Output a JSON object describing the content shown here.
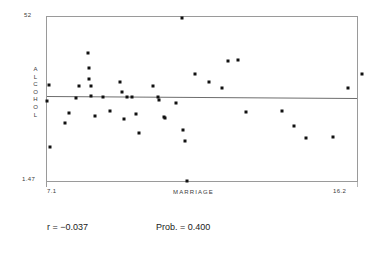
{
  "figure": {
    "kind": "scatter-plot-with-regression-line"
  },
  "axes": {
    "y_title_letters": [
      "A",
      "L",
      "C",
      "O",
      "H",
      "O",
      "L"
    ],
    "y_title": "ALCOHOL",
    "y_max_label": "52",
    "y_min_label": "1.47",
    "x_title": "MARRIAGE",
    "x_min_label": "7.1",
    "x_max_label": "16.2"
  },
  "stats": {
    "r_label": "r = −0.037",
    "prob_label": "Prob. = 0.400"
  },
  "colors": {
    "point": "#111111",
    "frame": "#9a9a9a",
    "regression_line": "#6d6d6d",
    "background": "#ffffff",
    "text": "#1a1a1a"
  },
  "chart_data": {
    "type": "scatter",
    "title": "",
    "xlabel": "MARRIAGE",
    "ylabel": "ALCOHOL",
    "xlim": [
      7.1,
      16.2
    ],
    "ylim": [
      1.47,
      52
    ],
    "grid": false,
    "legend": null,
    "correlation_r": -0.037,
    "probability": 0.4,
    "regression_line": {
      "y_at_xmin": 27.6,
      "y_at_xmax": 27.0,
      "slope_sign": "slightly-negative"
    },
    "points": [
      {
        "x": 7.1,
        "y": 26.0
      },
      {
        "x": 7.15,
        "y": 31.2
      },
      {
        "x": 7.18,
        "y": 11.8
      },
      {
        "x": 7.62,
        "y": 19.4
      },
      {
        "x": 7.75,
        "y": 22.4
      },
      {
        "x": 7.95,
        "y": 27.1
      },
      {
        "x": 8.05,
        "y": 30.8
      },
      {
        "x": 8.3,
        "y": 41.0
      },
      {
        "x": 8.32,
        "y": 36.3
      },
      {
        "x": 8.34,
        "y": 33.0
      },
      {
        "x": 8.38,
        "y": 30.8
      },
      {
        "x": 8.4,
        "y": 27.6
      },
      {
        "x": 8.52,
        "y": 21.6
      },
      {
        "x": 8.75,
        "y": 27.4
      },
      {
        "x": 8.95,
        "y": 23.0
      },
      {
        "x": 9.25,
        "y": 31.9
      },
      {
        "x": 9.3,
        "y": 28.8
      },
      {
        "x": 9.35,
        "y": 20.6
      },
      {
        "x": 9.45,
        "y": 27.2
      },
      {
        "x": 9.6,
        "y": 27.2
      },
      {
        "x": 9.72,
        "y": 22.2
      },
      {
        "x": 9.8,
        "y": 16.2
      },
      {
        "x": 10.2,
        "y": 30.6
      },
      {
        "x": 10.35,
        "y": 27.4
      },
      {
        "x": 10.4,
        "y": 26.4
      },
      {
        "x": 10.52,
        "y": 21.3
      },
      {
        "x": 10.56,
        "y": 21.0
      },
      {
        "x": 10.9,
        "y": 25.4
      },
      {
        "x": 11.05,
        "y": 51.8
      },
      {
        "x": 11.1,
        "y": 17.2
      },
      {
        "x": 11.16,
        "y": 13.8
      },
      {
        "x": 11.2,
        "y": 1.47
      },
      {
        "x": 11.45,
        "y": 34.5
      },
      {
        "x": 11.85,
        "y": 32.0
      },
      {
        "x": 12.25,
        "y": 30.2
      },
      {
        "x": 12.4,
        "y": 38.3
      },
      {
        "x": 12.7,
        "y": 38.6
      },
      {
        "x": 12.95,
        "y": 22.6
      },
      {
        "x": 14.0,
        "y": 22.9
      },
      {
        "x": 14.35,
        "y": 18.3
      },
      {
        "x": 14.7,
        "y": 14.8
      },
      {
        "x": 15.5,
        "y": 14.9
      },
      {
        "x": 15.95,
        "y": 30.0
      },
      {
        "x": 16.35,
        "y": 34.4
      }
    ]
  }
}
